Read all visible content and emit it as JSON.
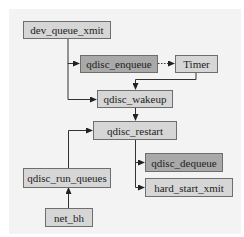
{
  "diagram": {
    "type": "flowchart",
    "colors": {
      "background": "#ffffff",
      "panel": "#f3f3f3",
      "node_light": "#d6d6d6",
      "node_dark": "#a9a9a9",
      "edge": "#333333"
    },
    "nodes": {
      "dev_queue_xmit": {
        "label": "dev_queue_xmit",
        "style": "light"
      },
      "qdisc_enqueue": {
        "label": "qdisc_enqueue",
        "style": "dark"
      },
      "timer": {
        "label": "Timer",
        "style": "light"
      },
      "qdisc_wakeup": {
        "label": "qdisc_wakeup",
        "style": "light"
      },
      "qdisc_restart": {
        "label": "qdisc_restart",
        "style": "light"
      },
      "qdisc_dequeue": {
        "label": "qdisc_dequeue",
        "style": "dark"
      },
      "hard_start_xmit": {
        "label": "hard_start_xmit",
        "style": "light"
      },
      "qdisc_run_queues": {
        "label": "qdisc_run_queues",
        "style": "light"
      },
      "net_bh": {
        "label": "net_bh",
        "style": "light"
      }
    },
    "edges": [
      {
        "from": "dev_queue_xmit",
        "to": "qdisc_enqueue",
        "style": "solid"
      },
      {
        "from": "dev_queue_xmit",
        "to": "qdisc_wakeup",
        "style": "solid"
      },
      {
        "from": "qdisc_enqueue",
        "to": "Timer",
        "style": "dotted"
      },
      {
        "from": "Timer",
        "to": "qdisc_wakeup",
        "style": "solid"
      },
      {
        "from": "qdisc_wakeup",
        "to": "qdisc_restart",
        "style": "solid"
      },
      {
        "from": "qdisc_restart",
        "to": "qdisc_dequeue",
        "style": "solid"
      },
      {
        "from": "qdisc_restart",
        "to": "hard_start_xmit",
        "style": "solid"
      },
      {
        "from": "qdisc_run_queues",
        "to": "qdisc_restart",
        "style": "solid"
      },
      {
        "from": "net_bh",
        "to": "qdisc_run_queues",
        "style": "solid"
      }
    ]
  }
}
